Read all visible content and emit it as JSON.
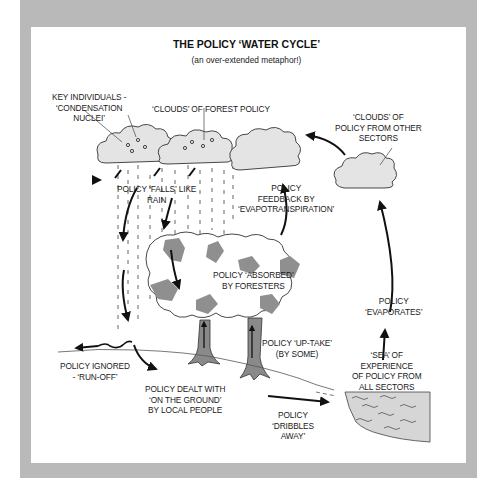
{
  "page": {
    "caption_fragment": "rain will never fall."
  },
  "diagram": {
    "title": "THE POLICY ‘WATER CYCLE’",
    "subtitle": "(an over-extended metaphor!)",
    "labels": {
      "key_individuals": [
        "KEY INDIVIDUALS -",
        "‘CONDENSATION",
        "NUCLEI’"
      ],
      "clouds_forest": [
        "‘CLOUDS’ OF FOREST POLICY"
      ],
      "clouds_other": [
        "‘CLOUDS’ OF",
        "POLICY FROM OTHER",
        "SECTORS"
      ],
      "falls_like_rain": [
        "POLICY ‘FALLS’ LIKE",
        "RAIN"
      ],
      "feedback": [
        "POLICY",
        "FEEDBACK BY",
        "‘EVAPOTRANSPIRATION’"
      ],
      "absorbed": [
        "POLICY ‘ABSORBED’",
        "BY FORESTERS"
      ],
      "evaporates": [
        "POLICY",
        "‘EVAPORATES’"
      ],
      "uptake": [
        "POLICY ‘UP-TAKE’",
        "(BY SOME)"
      ],
      "sea": [
        "‘SEA’ OF",
        "EXPERIENCE",
        "OF POLICY FROM",
        "ALL SECTORS"
      ],
      "ignored": [
        "POLICY IGNORED",
        "- ‘RUN-OFF’"
      ],
      "dealt_with": [
        "POLICY DEALT WITH",
        "‘ON THE GROUND’",
        "BY LOCAL PEOPLE"
      ],
      "dribbles": [
        "POLICY",
        "‘DRIBBLES",
        "AWAY’"
      ]
    },
    "colors": {
      "frame": "#b9b9b9",
      "cloud_fill": "#e4e4e4",
      "foliage_shade": "#8f8f8f",
      "trunk": "#8a8a8a",
      "sea_fill": "#d6d6d6",
      "ink": "#111111"
    }
  }
}
